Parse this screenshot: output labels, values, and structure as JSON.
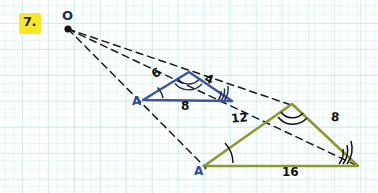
{
  "page": {
    "problem_number": "7.",
    "highlight_color": "#f7e827",
    "background": "graph-paper",
    "grid_color": "#c4e2e4"
  },
  "diagram": {
    "type": "dilation-similar-triangles",
    "center_label": "O",
    "colors": {
      "small_triangle": "#3b55a0",
      "large_triangle": "#8a9a2b",
      "ray": "#1a1a1a",
      "vertex_label": "#2f4a9b"
    },
    "center_point": {
      "x": 67,
      "y": 28
    },
    "small_triangle": {
      "label": "A",
      "vertex_label": "A",
      "vertices": {
        "a": {
          "x": 143,
          "y": 100
        },
        "apex": {
          "x": 189,
          "y": 72
        },
        "right": {
          "x": 232,
          "y": 101
        }
      },
      "sides": [
        {
          "name": "left-side",
          "value": "6"
        },
        {
          "name": "right-side",
          "value": "4"
        },
        {
          "name": "base",
          "value": "8"
        }
      ],
      "angle_marks": {
        "a": 1,
        "apex": 2,
        "right": 3
      }
    },
    "large_triangle": {
      "label": "A'",
      "vertex_label": "A'",
      "vertices": {
        "a": {
          "x": 204,
          "y": 166
        },
        "apex": {
          "x": 292,
          "y": 104
        },
        "right": {
          "x": 358,
          "y": 166
        }
      },
      "sides": [
        {
          "name": "left-side",
          "value": "12"
        },
        {
          "name": "right-side",
          "value": "8"
        },
        {
          "name": "base",
          "value": "16"
        }
      ],
      "angle_marks": {
        "a": 1,
        "apex": 2,
        "right": 3
      }
    },
    "rays": [
      {
        "name": "ray-to-A-Aprime",
        "from": "O",
        "through": "A",
        "to": "A'"
      },
      {
        "name": "ray-to-apex",
        "from": "O",
        "through": "small-apex",
        "to": "large-apex"
      },
      {
        "name": "ray-to-right-vertex",
        "from": "O",
        "through": "small-right",
        "to": "large-right"
      }
    ]
  }
}
